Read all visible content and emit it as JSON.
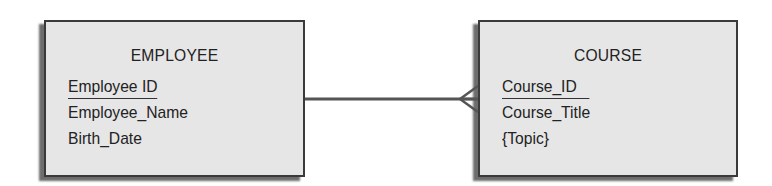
{
  "diagram": {
    "type": "entity-relationship",
    "entities": [
      {
        "name": "EMPLOYEE",
        "primary_key": "Employee ID",
        "attributes": [
          "Employee_Name",
          "Birth_Date"
        ]
      },
      {
        "name": "COURSE",
        "primary_key": "Course_ID",
        "attributes": [
          "Course_Title",
          "{Topic}"
        ]
      }
    ],
    "relationship": {
      "from": "EMPLOYEE",
      "to": "COURSE",
      "from_cardinality": "one",
      "to_cardinality": "many",
      "notation": "crow's foot"
    },
    "colors": {
      "entity_fill": "#e6e6e6",
      "entity_border": "#3a3a3a",
      "line": "#555555",
      "background": "#ffffff"
    }
  }
}
